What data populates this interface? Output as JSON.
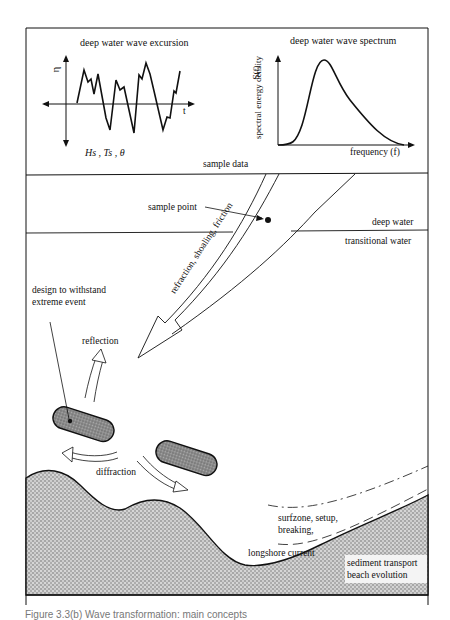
{
  "diagram": {
    "title_panel_left": "deep water wave excursion",
    "title_panel_right": "deep water wave spectrum",
    "left_axis_y": "η",
    "left_axis_x": "t",
    "left_params": "Hs , Ts , θ",
    "right_axis_y": "spectral energy density S(f)",
    "right_axis_y_line1": "spectral energy density",
    "right_axis_y_line2": "S(f)",
    "right_axis_x": "frequency (f)",
    "sample_data": "sample data",
    "sample_point": "sample point",
    "deep_water": "deep water",
    "transitional_water": "transitional water",
    "arrow_label": "refraction, shoaling, friction",
    "design_label_1": "design to withstand",
    "design_label_2": "extreme event",
    "reflection": "reflection",
    "diffraction": "diffraction",
    "surfzone_1": "surfzone, setup,",
    "surfzone_2": "breaking,",
    "longshore": "longshore current",
    "sediment_1": "sediment transport",
    "sediment_2": "beach evolution",
    "caption": "Figure 3.3(b) Wave transformation: main concepts",
    "colors": {
      "ink": "#111111",
      "breakwater_fill": "#8a8a8a",
      "land_fill": "#c8c8c8",
      "background": "#ffffff"
    }
  }
}
